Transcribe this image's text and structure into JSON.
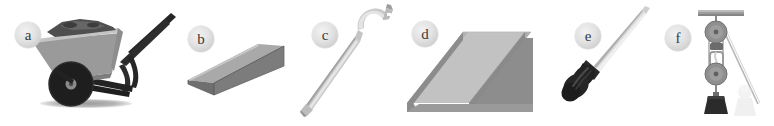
{
  "figure": {
    "type": "labeled-illustration-strip",
    "background_color": "#ffffff",
    "panel_count": 6
  },
  "panels": [
    {
      "id": "a",
      "label": "a",
      "object_name": "wheelbarrow",
      "icon_name": "wheelbarrow-illustration",
      "colors": {
        "tray": "#9a9a9a",
        "tray_top": "#bdbdbd",
        "load": "#4f4f4f",
        "frame": "#262626",
        "tire": "#1e1e1e",
        "shadow": "#a6a6a6"
      }
    },
    {
      "id": "b",
      "label": "b",
      "object_name": "wedge",
      "icon_name": "wedge-block-illustration",
      "colors": {
        "top_face": "#a8a8a8",
        "front_face": "#7b7b7b",
        "side_face": "#6e6e6e",
        "edge": "#585858"
      }
    },
    {
      "id": "c",
      "label": "c",
      "object_name": "crowbar",
      "icon_name": "crowbar-illustration",
      "colors": {
        "shaft": "#c9c9c9",
        "shaft_shade": "#9f9f9f",
        "highlight": "#e8e8e8"
      }
    },
    {
      "id": "d",
      "label": "d",
      "object_name": "inclined plane",
      "icon_name": "inclined-plane-illustration",
      "colors": {
        "ramp_surface": "#c2c2c2",
        "ramp_side": "#8e8e8e",
        "rail_top": "#b0b0b0",
        "rail_shade": "#777777"
      }
    },
    {
      "id": "e",
      "label": "e",
      "object_name": "screwdriver",
      "icon_name": "screwdriver-illustration",
      "colors": {
        "handle": "#262626",
        "shaft": "#dcdcdc",
        "shaft_edge": "#b0b0b0"
      }
    },
    {
      "id": "f",
      "label": "f",
      "object_name": "pulley system",
      "icon_name": "pulley-system-illustration",
      "colors": {
        "beam": "#9e9e9e",
        "wheel": "#8f8f8f",
        "wheel_dark": "#6f6f6f",
        "rope": "#b5b5b5",
        "weight": "#2b2b2b",
        "ghost": "#e3e3e3"
      }
    }
  ]
}
